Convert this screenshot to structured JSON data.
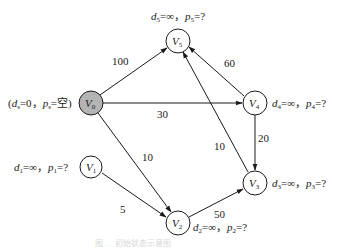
{
  "diagram": {
    "type": "directed-weighted-graph",
    "nodes": [
      {
        "id": "V0",
        "name": "V",
        "sub": "0",
        "x": 91,
        "y": 103,
        "fill": "#b4b4b4",
        "label": {
          "pre": "(",
          "d": "d",
          "ds": "s",
          "dval": "=0，",
          "p": "p",
          "ps": "s",
          "pval": "=空)"
        }
      },
      {
        "id": "V1",
        "name": "V",
        "sub": "1",
        "x": 91,
        "y": 167,
        "fill": "#ffffff",
        "label": {
          "d": "d",
          "ds": "1",
          "dval": "=∞，",
          "p": "p",
          "ps": "1",
          "pval": "=?"
        }
      },
      {
        "id": "V2",
        "name": "V",
        "sub": "2",
        "x": 178,
        "y": 223,
        "fill": "#ffffff",
        "label": {
          "d": "d",
          "ds": "2",
          "dval": "=∞，",
          "p": "p",
          "ps": "2",
          "pval": "=?"
        }
      },
      {
        "id": "V3",
        "name": "V",
        "sub": "3",
        "x": 255,
        "y": 183,
        "fill": "#ffffff",
        "label": {
          "d": "d",
          "ds": "3",
          "dval": "=∞，",
          "p": "p",
          "ps": "3",
          "pval": "=?"
        }
      },
      {
        "id": "V4",
        "name": "V",
        "sub": "4",
        "x": 255,
        "y": 103,
        "fill": "#ffffff",
        "label": {
          "d": "d",
          "ds": "4",
          "dval": "=∞，",
          "p": "p",
          "ps": "4",
          "pval": "=?"
        }
      },
      {
        "id": "V5",
        "name": "V",
        "sub": "5",
        "x": 178,
        "y": 41,
        "fill": "#ffffff",
        "label": {
          "d": "d",
          "ds": "5",
          "dval": "=∞，",
          "p": "p",
          "ps": "5",
          "pval": "=?"
        }
      }
    ],
    "edges": [
      {
        "from": "V0",
        "to": "V5",
        "weight": "100"
      },
      {
        "from": "V0",
        "to": "V4",
        "weight": "30"
      },
      {
        "from": "V0",
        "to": "V2",
        "weight": "10"
      },
      {
        "from": "V4",
        "to": "V5",
        "weight": "60"
      },
      {
        "from": "V3",
        "to": "V5",
        "weight": "10"
      },
      {
        "from": "V4",
        "to": "V3",
        "weight": "20"
      },
      {
        "from": "V1",
        "to": "V2",
        "weight": "5"
      },
      {
        "from": "V2",
        "to": "V3",
        "weight": "50"
      }
    ],
    "caption": "图 … 初始状态示意图"
  }
}
